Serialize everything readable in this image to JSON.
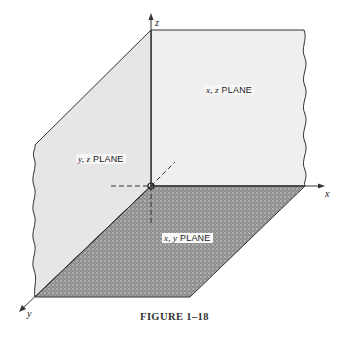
{
  "figure": {
    "caption": "FIGURE 1–18",
    "planes": {
      "xz": {
        "var": "x, z",
        "label": "PLANE"
      },
      "yz": {
        "var": "y, z",
        "label": "PLANE"
      },
      "xy": {
        "var": "x, y",
        "label": "PLANE"
      }
    },
    "axes": {
      "x": "x",
      "y": "y",
      "z": "z"
    },
    "colors": {
      "plane_light": "#ececec",
      "plane_dark": "#9a9a9a",
      "line": "#333333"
    }
  }
}
